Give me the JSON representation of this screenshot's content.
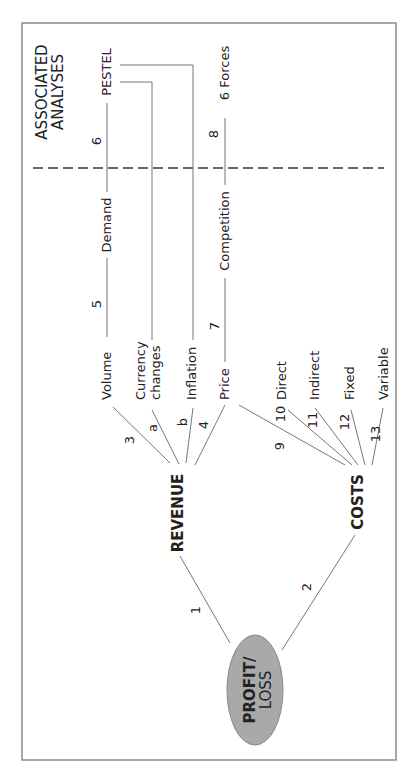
{
  "diagram": {
    "root": {
      "label_line1": "PROFIT/",
      "label_line2": "LOSS",
      "fill": "#a9a9a9"
    },
    "branches": {
      "revenue": "REVENUE",
      "costs": "COSTS"
    },
    "section_header": {
      "line1": "ASSOCIATED",
      "line2": "ANALYSES"
    },
    "revenue_drivers": {
      "volume": "Volume",
      "currency_line1": "Currency",
      "currency_line2": "changes",
      "inflation": "Inflation",
      "price": "Price"
    },
    "cost_types": {
      "direct": "Direct",
      "indirect": "Indirect",
      "fixed": "Fixed",
      "variable": "Variable"
    },
    "intermediate": {
      "demand": "Demand",
      "competition": "Competition"
    },
    "analyses": {
      "pestel": "PESTEL",
      "six_forces": "6 Forces"
    },
    "link_numbers": {
      "n1": "1",
      "n2": "2",
      "n3": "3",
      "n4": "4",
      "n5": "5",
      "n6": "6",
      "n7": "7",
      "n8": "8",
      "n9": "9",
      "n10": "10",
      "n11": "11",
      "n12": "12",
      "n13": "13",
      "na": "a",
      "nb": "b"
    }
  }
}
